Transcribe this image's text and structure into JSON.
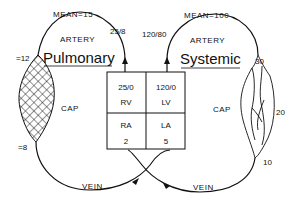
{
  "pulmonary": {
    "title": "Pulmonary",
    "mean_label": "MEAN=15",
    "artery_label": "ARTERY",
    "artery_pressure": "25/8",
    "cap_label": "CAP",
    "cap_in_pressure": "=12",
    "cap_out_pressure": "=8",
    "vein_label": "VEIN"
  },
  "systemic": {
    "title": "Systemic",
    "mean_label": "MEAN=100",
    "artery_label": "ARTERY",
    "artery_pressure": "120/80",
    "cap_label": "CAP",
    "cap_in_pressure": "30",
    "cap_mid_pressure": "20",
    "cap_out_pressure": "10",
    "vein_label": "VEIN"
  },
  "heart": {
    "rv": {
      "pressure": "25/0",
      "label": "RV"
    },
    "lv": {
      "pressure": "120/0",
      "label": "LV"
    },
    "ra": {
      "label": "RA",
      "pressure": "2"
    },
    "la": {
      "label": "LA",
      "pressure": "5"
    }
  },
  "colors": {
    "line": "#111111",
    "background": "#ffffff"
  }
}
